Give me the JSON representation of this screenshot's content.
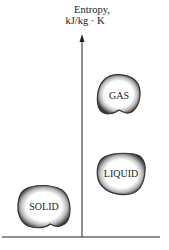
{
  "axis": {
    "label_line1": "Entropy,",
    "label_line2": "kJ/kg · K"
  },
  "phases": [
    {
      "name": "GAS"
    },
    {
      "name": "LIQUID"
    },
    {
      "name": "SOLID"
    }
  ],
  "colors": {
    "line": "#222222",
    "blob_edge": "#333333",
    "blob_fill": "#ffffff"
  }
}
